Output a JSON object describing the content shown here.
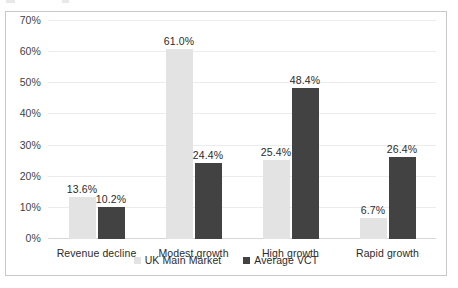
{
  "chart_data": {
    "type": "bar",
    "title": "",
    "subtitle": "",
    "xlabel": "",
    "ylabel": "",
    "categories": [
      "Revenue decline",
      "Modest growth",
      "High growth",
      "Rapid growth"
    ],
    "series": [
      {
        "name": "UK Main Market",
        "color": "#e3e3e3",
        "values": [
          13.6,
          61.0,
          25.4,
          6.7
        ],
        "labels": [
          "13.6%",
          "61.0%",
          "25.4%",
          "6.7%"
        ]
      },
      {
        "name": "Average VCT",
        "color": "#424242",
        "values": [
          10.2,
          24.4,
          48.4,
          26.4
        ],
        "labels": [
          "10.2%",
          "24.4%",
          "48.4%",
          "26.4%"
        ]
      }
    ],
    "ylim": [
      0,
      70
    ],
    "ytick_values": [
      70,
      60,
      50,
      40,
      30,
      20,
      10,
      0
    ],
    "ytick_labels": [
      "70%",
      "60%",
      "50%",
      "40%",
      "30%",
      "20%",
      "10%",
      "0%"
    ],
    "grid": true,
    "grid_axis": "y",
    "legend_position": "bottom",
    "data_labels": true,
    "plot_background": "#ffffff",
    "grid_color": "#ececec",
    "border_color": "#c9c9c9",
    "text_color": "#2b2b2b"
  }
}
